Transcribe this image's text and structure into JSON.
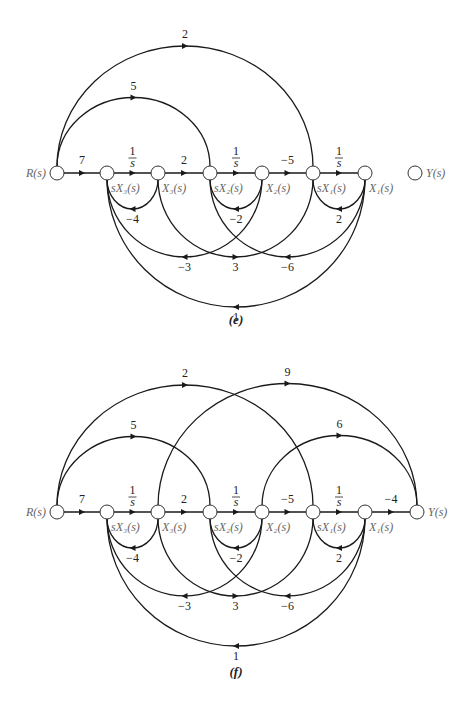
{
  "figure": {
    "diagrams": [
      {
        "id": "e",
        "caption": "(e)",
        "row_y": 173,
        "caption_y": 324,
        "nodes": [
          {
            "id": "R",
            "x": 57,
            "label": "R(s)",
            "label_side": "left"
          },
          {
            "id": "sX3",
            "x": 107,
            "label": "sX₃(s)",
            "label_side": "below"
          },
          {
            "id": "X3",
            "x": 158,
            "label": "X₃(s)",
            "label_side": "below"
          },
          {
            "id": "sX2",
            "x": 210,
            "label": "sX₂(s)",
            "label_side": "below"
          },
          {
            "id": "X2",
            "x": 262,
            "label": "X₂(s)",
            "label_side": "below"
          },
          {
            "id": "sX1",
            "x": 313,
            "label": "sX₁(s)",
            "label_side": "below"
          },
          {
            "id": "X1",
            "x": 365,
            "label": "X₁(s)",
            "label_side": "below"
          },
          {
            "id": "Y",
            "x": 415,
            "label": "Y(s)",
            "label_side": "right"
          }
        ],
        "forward_edges": [
          {
            "from": "R",
            "to": "sX3",
            "gain": "7"
          },
          {
            "from": "sX3",
            "to": "X3",
            "gain": "1/s"
          },
          {
            "from": "X3",
            "to": "sX2",
            "gain": "2"
          },
          {
            "from": "sX2",
            "to": "X2",
            "gain": "1/s"
          },
          {
            "from": "X2",
            "to": "sX1",
            "gain": "−5"
          },
          {
            "from": "sX1",
            "to": "X1",
            "gain": "1/s"
          }
        ],
        "upper_arcs": [
          {
            "from": "R",
            "to": "sX2",
            "gain": "5"
          },
          {
            "from": "R",
            "to": "sX1",
            "gain": "2"
          }
        ],
        "lower_arcs": [
          {
            "from": "X3",
            "to": "sX3",
            "gain": "−4",
            "depth": 30
          },
          {
            "from": "X2",
            "to": "sX2",
            "gain": "−2",
            "depth": 30
          },
          {
            "from": "X1",
            "to": "sX1",
            "gain": "2",
            "depth": 30
          },
          {
            "from": "X2",
            "to": "sX3",
            "gain": "−3",
            "depth": 78
          },
          {
            "from": "X3",
            "to": "sX1",
            "gain": "3",
            "depth": 78
          },
          {
            "from": "X1",
            "to": "sX2",
            "gain": "−6",
            "depth": 78
          },
          {
            "from": "X1",
            "to": "sX3",
            "gain": "1",
            "depth": 128
          }
        ]
      },
      {
        "id": "f",
        "caption": "(f)",
        "row_y": 512,
        "caption_y": 676,
        "nodes": [
          {
            "id": "R",
            "x": 57,
            "label": "R(s)",
            "label_side": "left"
          },
          {
            "id": "sX3",
            "x": 107,
            "label": "sX₃(s)",
            "label_side": "below"
          },
          {
            "id": "X3",
            "x": 158,
            "label": "X₃(s)",
            "label_side": "below"
          },
          {
            "id": "sX2",
            "x": 210,
            "label": "sX₂(s)",
            "label_side": "below"
          },
          {
            "id": "X2",
            "x": 262,
            "label": "X₂(s)",
            "label_side": "below"
          },
          {
            "id": "sX1",
            "x": 313,
            "label": "sX₁(s)",
            "label_side": "below"
          },
          {
            "id": "X1",
            "x": 365,
            "label": "X₁(s)",
            "label_side": "below"
          },
          {
            "id": "Y",
            "x": 417,
            "label": "Y(s)",
            "label_side": "right"
          }
        ],
        "forward_edges": [
          {
            "from": "R",
            "to": "sX3",
            "gain": "7"
          },
          {
            "from": "sX3",
            "to": "X3",
            "gain": "1/s"
          },
          {
            "from": "X3",
            "to": "sX2",
            "gain": "2"
          },
          {
            "from": "sX2",
            "to": "X2",
            "gain": "1/s"
          },
          {
            "from": "X2",
            "to": "sX1",
            "gain": "−5"
          },
          {
            "from": "sX1",
            "to": "X1",
            "gain": "1/s"
          },
          {
            "from": "X1",
            "to": "Y",
            "gain": "−4"
          }
        ],
        "upper_arcs": [
          {
            "from": "R",
            "to": "sX2",
            "gain": "5"
          },
          {
            "from": "R",
            "to": "sX1",
            "gain": "2"
          },
          {
            "from": "X3",
            "to": "Y",
            "gain": "9"
          },
          {
            "from": "X2",
            "to": "Y",
            "gain": "6"
          }
        ],
        "lower_arcs": [
          {
            "from": "X3",
            "to": "sX3",
            "gain": "−4",
            "depth": 30
          },
          {
            "from": "X2",
            "to": "sX2",
            "gain": "−2",
            "depth": 30
          },
          {
            "from": "X1",
            "to": "sX1",
            "gain": "2",
            "depth": 30
          },
          {
            "from": "X2",
            "to": "sX3",
            "gain": "−3",
            "depth": 78
          },
          {
            "from": "X3",
            "to": "sX1",
            "gain": "3",
            "depth": 78
          },
          {
            "from": "X1",
            "to": "sX2",
            "gain": "−6",
            "depth": 78
          },
          {
            "from": "X1",
            "to": "sX3",
            "gain": "1",
            "depth": 128
          }
        ]
      }
    ]
  },
  "style": {
    "line_color": "#1a1a1a",
    "node_fill": "#ffffff",
    "node_stroke": "#333333",
    "label_color": "#666666",
    "node_radius": 7
  }
}
